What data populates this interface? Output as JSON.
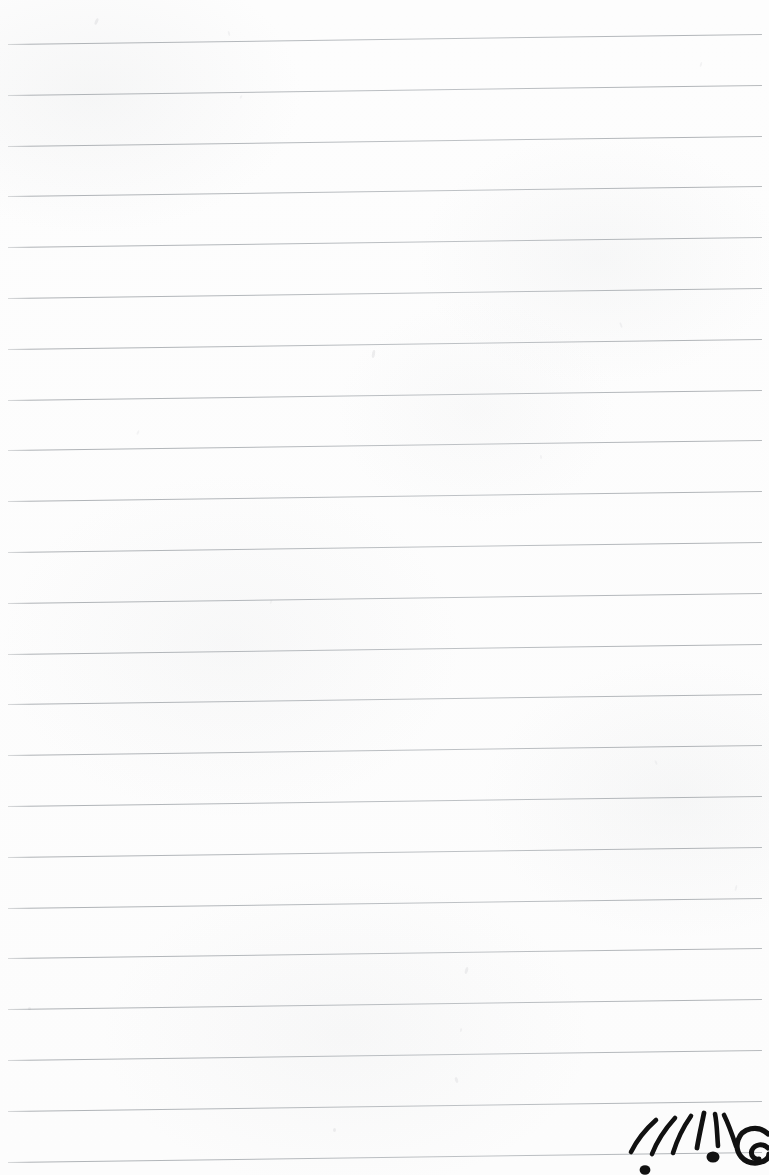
{
  "document": {
    "kind": "lined-notebook-paper-scan",
    "title": "Blank ruled notebook page with ink doodle",
    "width_px": 769,
    "height_px": 1175,
    "paper_color": "#fdfdfd",
    "rule_color": "#b8bcc0",
    "ink_color": "#111111",
    "text_content": "",
    "visible_text": []
  },
  "ruling": {
    "style": "wide-ruled",
    "line_count": 23,
    "first_line_y": 44,
    "line_spacing_px": 50.8,
    "line_thickness_px": 1,
    "tilt_degrees": -0.76,
    "left_margin_px": 8,
    "line_length_px": 754,
    "margin_rule": "none",
    "holes": "none"
  },
  "smudges": [
    {
      "x": 95,
      "y": 18,
      "w": 3,
      "h": 7,
      "rot": 22,
      "opacity": 0.3
    },
    {
      "x": 228,
      "y": 31,
      "w": 2,
      "h": 5,
      "rot": -14,
      "opacity": 0.2
    },
    {
      "x": 372,
      "y": 350,
      "w": 3,
      "h": 8,
      "rot": 10,
      "opacity": 0.32
    },
    {
      "x": 240,
      "y": 95,
      "w": 2,
      "h": 4,
      "rot": 30,
      "opacity": 0.18
    },
    {
      "x": 620,
      "y": 322,
      "w": 2,
      "h": 6,
      "rot": -20,
      "opacity": 0.22
    },
    {
      "x": 700,
      "y": 62,
      "w": 2,
      "h": 5,
      "rot": 18,
      "opacity": 0.2
    },
    {
      "x": 540,
      "y": 455,
      "w": 2,
      "h": 4,
      "rot": -8,
      "opacity": 0.18
    },
    {
      "x": 137,
      "y": 430,
      "w": 2,
      "h": 5,
      "rot": 25,
      "opacity": 0.2
    },
    {
      "x": 465,
      "y": 967,
      "w": 3,
      "h": 7,
      "rot": 15,
      "opacity": 0.28
    },
    {
      "x": 455,
      "y": 1077,
      "w": 3,
      "h": 6,
      "rot": -18,
      "opacity": 0.26
    },
    {
      "x": 333,
      "y": 1128,
      "w": 3,
      "h": 4,
      "rot": 0,
      "opacity": 0.3
    },
    {
      "x": 460,
      "y": 1028,
      "w": 2,
      "h": 4,
      "rot": 12,
      "opacity": 0.2
    },
    {
      "x": 28,
      "y": 1007,
      "w": 3,
      "h": 3,
      "rot": 0,
      "opacity": 0.24
    },
    {
      "x": 655,
      "y": 760,
      "w": 2,
      "h": 5,
      "rot": -25,
      "opacity": 0.18
    },
    {
      "x": 270,
      "y": 600,
      "w": 2,
      "h": 4,
      "rot": 20,
      "opacity": 0.16
    },
    {
      "x": 735,
      "y": 885,
      "w": 2,
      "h": 6,
      "rot": 14,
      "opacity": 0.2
    }
  ],
  "doodle": {
    "name": "ink-doodle-bottom-right",
    "description": "Hand-drawn black ink doodle: a fan of six radiating strokes above a large dot resting on the last ruled line, a smaller dot below-left, and a thick spiral curl at the right, cropped by the page edge.",
    "ink_color": "#111111",
    "position": {
      "x": 600,
      "y": 1090,
      "width": 169,
      "height": 85
    },
    "cropped_by_page_edge": true,
    "elements": [
      {
        "part": "radiating-stroke",
        "index": 1
      },
      {
        "part": "radiating-stroke",
        "index": 2
      },
      {
        "part": "radiating-stroke",
        "index": 3
      },
      {
        "part": "radiating-stroke",
        "index": 4
      },
      {
        "part": "radiating-stroke",
        "index": 5
      },
      {
        "part": "radiating-stroke",
        "index": 6
      },
      {
        "part": "large-dot"
      },
      {
        "part": "small-dot"
      },
      {
        "part": "spiral-curl"
      }
    ]
  }
}
